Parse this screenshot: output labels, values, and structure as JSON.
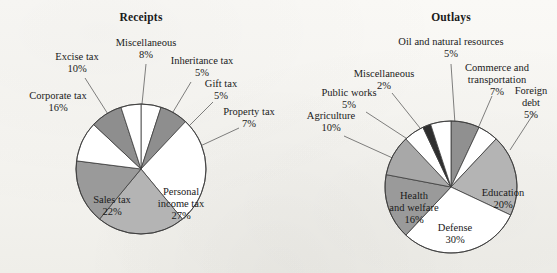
{
  "figure": {
    "background_color": "#f7f6f3",
    "ink_color": "#1a1a1a"
  },
  "charts": [
    {
      "id": "receipts",
      "title": "Receipts",
      "center": [
        141,
        169
      ],
      "radius": 65,
      "start_angle_deg": 0,
      "labels": {
        "gift_tax": {
          "name": "Gift tax",
          "pct": "5%"
        },
        "property_tax": {
          "name": "Property tax",
          "pct": "7%"
        },
        "personal_income": {
          "name": "Personal",
          "name2": "income tax",
          "pct": "27%"
        },
        "sales_tax": {
          "name": "Sales tax",
          "pct": "22%"
        },
        "corporate_tax": {
          "name": "Corporate tax",
          "pct": "16%"
        },
        "excise_tax": {
          "name": "Excise tax",
          "pct": "10%"
        },
        "miscellaneous": {
          "name": "Miscellaneous",
          "pct": "8%"
        },
        "inheritance_tax": {
          "name": "Inheritance tax",
          "pct": "5%"
        }
      }
    },
    {
      "id": "outlays",
      "title": "Outlays",
      "center": [
        451,
        187
      ],
      "radius": 66,
      "start_angle_deg": 0,
      "labels": {
        "commerce": {
          "name": "Commerce and",
          "name2": "transportation",
          "pct": "7%"
        },
        "foreign_debt": {
          "name": "Foreign",
          "name2": "debt",
          "pct": "5%"
        },
        "education": {
          "name": "Education",
          "pct": "20%"
        },
        "defense": {
          "name": "Defense",
          "pct": "30%"
        },
        "health": {
          "name": "Health",
          "name2": "and welfare",
          "pct": "16%"
        },
        "agriculture": {
          "name": "Agriculture",
          "pct": "10%"
        },
        "public_works": {
          "name": "Public works",
          "pct": "5%"
        },
        "miscellaneous": {
          "name": "Miscellaneous",
          "pct": "2%"
        },
        "oil": {
          "name": "Oil and natural resources",
          "pct": "5%"
        }
      }
    }
  ],
  "chart_data": [
    {
      "type": "pie",
      "title": "Receipts",
      "xlabel": "",
      "ylabel": "",
      "legend_position": "none",
      "grid": false,
      "units": "percent",
      "start_angle_deg": 90,
      "direction": "clockwise",
      "categories": [
        "Gift tax",
        "Property tax",
        "Personal income tax",
        "Sales tax",
        "Corporate tax",
        "Excise tax",
        "Miscellaneous",
        "Inheritance tax"
      ],
      "values": [
        5,
        7,
        27,
        22,
        16,
        10,
        8,
        5
      ],
      "labels": [
        "5%",
        "7%",
        "27%",
        "22%",
        "16%",
        "10%",
        "8%",
        "5%"
      ],
      "colors": [
        "#ffffff",
        "#8e8e8e",
        "#ffffff",
        "#b4b4b4",
        "#9a9a9a",
        "#ffffff",
        "#8e8e8e",
        "#ffffff"
      ],
      "total": 100
    },
    {
      "type": "pie",
      "title": "Outlays",
      "xlabel": "",
      "ylabel": "",
      "legend_position": "none",
      "grid": false,
      "units": "percent",
      "start_angle_deg": 90,
      "direction": "clockwise",
      "categories": [
        "Commerce and transportation",
        "Foreign debt",
        "Education",
        "Defense",
        "Health and welfare",
        "Agriculture",
        "Public works",
        "Miscellaneous",
        "Oil and natural resources"
      ],
      "values": [
        7,
        5,
        20,
        30,
        16,
        10,
        5,
        2,
        5
      ],
      "labels": [
        "7%",
        "5%",
        "20%",
        "30%",
        "16%",
        "10%",
        "5%",
        "2%",
        "5%"
      ],
      "colors": [
        "#909090",
        "#ffffff",
        "#b4b4b4",
        "#ffffff",
        "#9a9a9a",
        "#a8a8a8",
        "#ffffff",
        "#2e2e2e",
        "#ffffff"
      ],
      "total": 100
    }
  ]
}
